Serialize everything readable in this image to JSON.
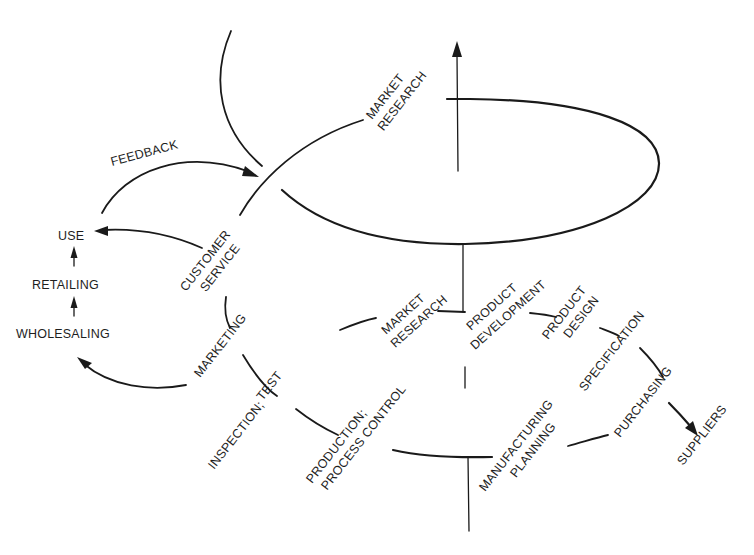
{
  "diagram": {
    "type": "spiral-of-quality",
    "stroke_color": "#1a1a1a",
    "background": "#ffffff",
    "labels": {
      "feedback": "FEEDBACK",
      "use": "USE",
      "retailing": "RETAILING",
      "wholesaling": "WHOLESALING",
      "customer_service": [
        "CUSTOMER",
        "SERVICE"
      ],
      "marketing": "MARKETING",
      "inspection_test": [
        "INSPECTION;",
        "TEST"
      ],
      "production": [
        "PRODUCTION;",
        "PROCESS CONTROL"
      ],
      "market_research_upper": [
        "MARKET",
        "RESEARCH"
      ],
      "market_research_lower": [
        "MARKET",
        "RESEARCH"
      ],
      "product_development": [
        "PRODUCT",
        "DEVELOPMENT"
      ],
      "product_design": [
        "PRODUCT",
        "DESIGN"
      ],
      "specification": "SPECIFICATION",
      "purchasing": "PURCHASING",
      "suppliers": "SUPPLIERS",
      "manufacturing_planning": [
        "MANUFACTURING",
        "PLANNING"
      ]
    },
    "flow_sequence": [
      "MARKET RESEARCH",
      "PRODUCT DEVELOPMENT",
      "PRODUCT DESIGN",
      "SPECIFICATION",
      "PURCHASING",
      "MANUFACTURING PLANNING",
      "PRODUCTION; PROCESS CONTROL",
      "INSPECTION; TEST",
      "MARKETING",
      "CUSTOMER SERVICE",
      "MARKET RESEARCH"
    ],
    "side_chain": [
      "WHOLESALING",
      "RETAILING",
      "USE"
    ],
    "external": [
      "SUPPLIERS"
    ],
    "feedback_edge": {
      "from": "USE",
      "to": "CUSTOMER SERVICE / next loop",
      "label": "FEEDBACK"
    }
  }
}
